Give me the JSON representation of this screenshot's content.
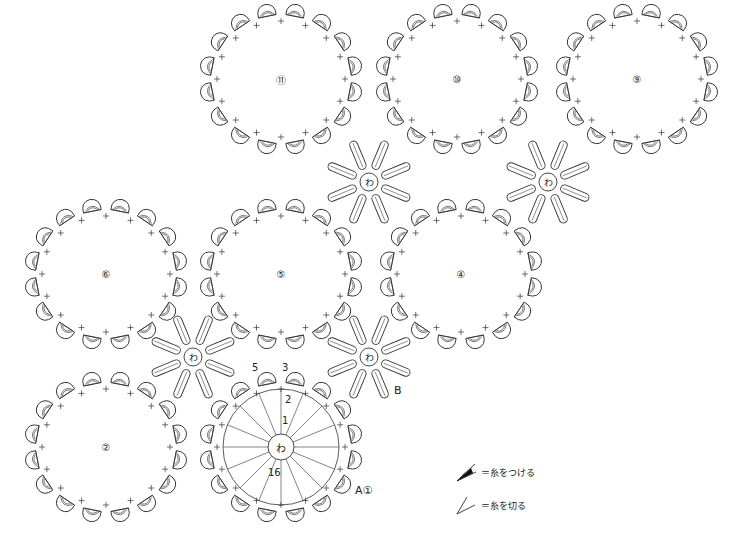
{
  "diagram": {
    "type": "crochet-chart",
    "ring_symbol": "わ",
    "large_motifs": [
      {
        "id": "11",
        "label": "⑪",
        "cx": 281,
        "cy": 79
      },
      {
        "id": "10",
        "label": "⑩",
        "cx": 457,
        "cy": 79
      },
      {
        "id": "9",
        "label": "⑨",
        "cx": 637,
        "cy": 79
      },
      {
        "id": "6",
        "label": "⑥",
        "cx": 106,
        "cy": 274
      },
      {
        "id": "5",
        "label": "⑤",
        "cx": 281,
        "cy": 274
      },
      {
        "id": "4",
        "label": "④",
        "cx": 461,
        "cy": 274
      },
      {
        "id": "2",
        "label": "②",
        "cx": 106,
        "cy": 447
      },
      {
        "id": "1",
        "label": "わ",
        "cx": 281,
        "cy": 447,
        "detailed": true
      }
    ],
    "star_motifs": [
      {
        "cx": 369,
        "cy": 182,
        "label": "わ"
      },
      {
        "cx": 548,
        "cy": 182,
        "label": "わ"
      },
      {
        "cx": 193,
        "cy": 357,
        "label": "わ"
      },
      {
        "cx": 369,
        "cy": 357,
        "label": "わ"
      }
    ],
    "round_numbers": {
      "r1": "1",
      "r2": "2",
      "r3": "3",
      "r5": "5",
      "r16": "16"
    },
    "annotations": {
      "a": "A①",
      "b": "B"
    },
    "legend": [
      {
        "symbol": "filled-wedge",
        "text": "＝糸をつける"
      },
      {
        "symbol": "open-wedge",
        "text": "＝糸を切る"
      }
    ]
  }
}
